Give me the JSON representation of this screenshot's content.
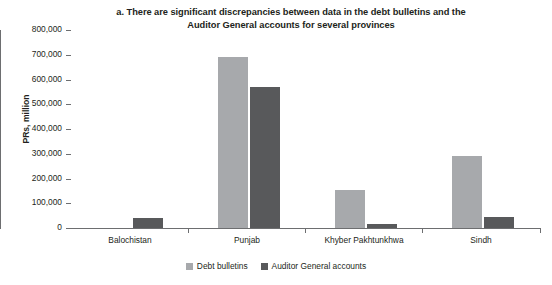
{
  "chart_data": {
    "type": "bar",
    "title": "a. There are significant discrepancies between data in the debt bulletins and the Auditor General accounts for several provinces",
    "title_lines": [
      "a. There are significant discrepancies between data in the debt bulletins and the",
      "Auditor General accounts for several provinces"
    ],
    "xlabel": "",
    "ylabel": "PRs, million",
    "ylim": [
      0,
      800000
    ],
    "ytick_interval": 100000,
    "ytick_labels": [
      "800,000",
      "700,000",
      "600,000",
      "500,000",
      "400,000",
      "300,000",
      "200,000",
      "100,000",
      "0"
    ],
    "ytick_values": [
      800000,
      700000,
      600000,
      500000,
      400000,
      300000,
      200000,
      100000,
      0
    ],
    "grid": false,
    "legend_position": "bottom-center",
    "categories": [
      "Balochistan",
      "Punjab",
      "Khyber Pakhtunkhwa",
      "Sindh"
    ],
    "series": [
      {
        "name": "Debt bulletins",
        "color": "#a7a9ac",
        "values": [
          0,
          690000,
          155000,
          290000
        ]
      },
      {
        "name": "Auditor General accounts",
        "color": "#58595b",
        "values": [
          40000,
          570000,
          15000,
          45000
        ]
      }
    ]
  },
  "legend": {
    "items": [
      {
        "label": "Debt bulletins",
        "swatch": "light-gray-square-icon"
      },
      {
        "label": "Auditor General accounts",
        "swatch": "dark-gray-square-icon"
      }
    ]
  },
  "colors": {
    "debt_bulletins": "#a7a9ac",
    "auditor_general": "#58595b",
    "axis": "#6d6e70",
    "text": "#231f20",
    "background": "#ffffff"
  }
}
